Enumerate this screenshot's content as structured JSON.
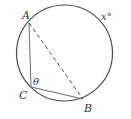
{
  "diagram": {
    "type": "circle-geometry",
    "stroke_color": "#4a4a4a",
    "circle": {
      "cx": 64.5,
      "cy": 53,
      "r": 48
    },
    "points": {
      "A": {
        "label": "A",
        "x": 29,
        "y": 23
      },
      "B": {
        "label": "B",
        "x": 83,
        "y": 99
      },
      "C": {
        "label": "C",
        "x": 31,
        "y": 87
      }
    },
    "segments": [
      {
        "from": "A",
        "to": "C",
        "style": "solid"
      },
      {
        "from": "C",
        "to": "B",
        "style": "solid"
      },
      {
        "from": "A",
        "to": "B",
        "style": "dashed"
      }
    ],
    "labels": {
      "A": "A",
      "B": "B",
      "C": "C",
      "angle_at_C": "θ",
      "arc": "x°"
    }
  }
}
